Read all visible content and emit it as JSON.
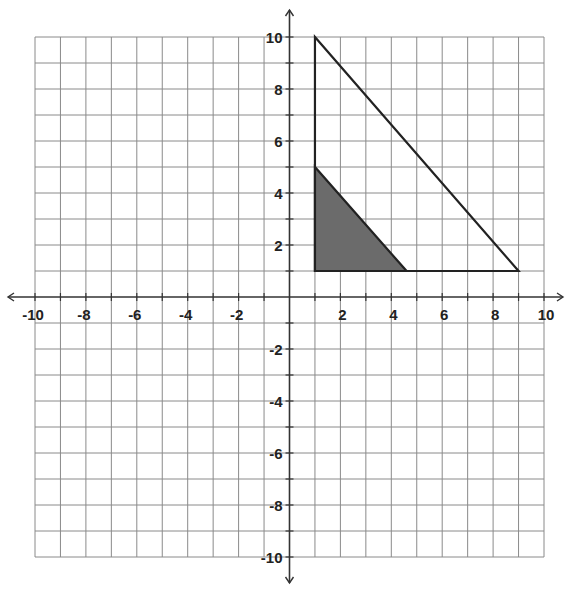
{
  "chart_data": {
    "type": "scatter",
    "title": "",
    "xlabel": "",
    "ylabel": "",
    "xlim": [
      -10,
      10
    ],
    "ylim": [
      -10,
      10
    ],
    "grid": true,
    "x_tick_labels": [
      "-10",
      "-8",
      "-6",
      "-4",
      "-2",
      "2",
      "4",
      "6",
      "8",
      "10"
    ],
    "y_tick_labels": [
      "10",
      "8",
      "6",
      "4",
      "2",
      "-2",
      "-4",
      "-6",
      "-8",
      "-10"
    ],
    "shapes": [
      {
        "name": "large-triangle",
        "fill": "none",
        "stroke": "#222222",
        "vertices": [
          [
            1,
            10
          ],
          [
            1,
            1
          ],
          [
            9,
            1
          ]
        ]
      },
      {
        "name": "shaded-triangle",
        "fill": "#6b6b6b",
        "stroke": "#222222",
        "vertices": [
          [
            1,
            5
          ],
          [
            1,
            1
          ],
          [
            4.6,
            1
          ]
        ]
      }
    ]
  },
  "colors": {
    "grid": "#8a8a8a",
    "axis": "#333333",
    "shape_stroke": "#222222",
    "shade": "#6b6b6b"
  }
}
